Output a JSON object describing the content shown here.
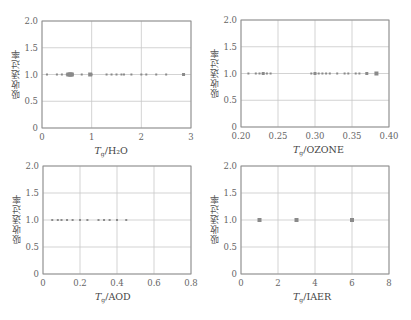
{
  "chart_data": [
    {
      "id": "h2o",
      "type": "scatter",
      "title": "",
      "ylabel": "吸收透过率",
      "xlabel_symbol": "T",
      "xlabel_sub": "g",
      "xlabel_var": "/H₂O",
      "xlim": [
        0,
        3
      ],
      "ylim": [
        0,
        2.0
      ],
      "xticks": [
        0,
        1,
        2,
        3
      ],
      "xtick_labels": [
        "0",
        "1",
        "2",
        "3"
      ],
      "yticks": [
        0,
        0.5,
        1.0,
        1.5,
        2.0
      ],
      "ytick_labels": [
        "0",
        "0.5",
        "1.0",
        "1.5",
        "2.0"
      ],
      "grid": true,
      "x": [
        0.1,
        0.3,
        0.4,
        0.5,
        0.53,
        0.56,
        0.58,
        0.6,
        0.62,
        0.8,
        0.97,
        1.0,
        1.3,
        1.4,
        1.5,
        1.6,
        1.65,
        1.8,
        2.0,
        2.1,
        2.3,
        2.5,
        2.85
      ],
      "y": [
        1.0,
        1.0,
        1.0,
        1.0,
        1.0,
        1.0,
        1.0,
        1.0,
        1.0,
        1.0,
        1.0,
        1.0,
        1.0,
        1.0,
        1.0,
        1.0,
        1.0,
        1.0,
        1.0,
        1.0,
        1.0,
        1.0,
        1.0
      ],
      "marker_sizes": [
        1,
        1,
        1,
        1,
        2,
        2,
        2,
        2,
        1,
        1,
        2,
        1,
        1,
        1,
        1,
        1,
        1,
        1,
        1,
        1,
        1,
        1,
        1.5
      ]
    },
    {
      "id": "ozone",
      "type": "scatter",
      "title": "",
      "ylabel": "吸收透过率",
      "xlabel_symbol": "T",
      "xlabel_sub": "g",
      "xlabel_var": "/OZONE",
      "xlim": [
        0.2,
        0.4
      ],
      "ylim": [
        0,
        2.0
      ],
      "xticks": [
        0.2,
        0.25,
        0.3,
        0.35,
        0.4
      ],
      "xtick_labels": [
        "0.20",
        "0.25",
        "0.30",
        "0.35",
        "0.40"
      ],
      "yticks": [
        0,
        0.5,
        1.0,
        1.5,
        2.0
      ],
      "ytick_labels": [
        "0",
        "0.5",
        "1.0",
        "1.5",
        "2.0"
      ],
      "grid": true,
      "x": [
        0.21,
        0.22,
        0.225,
        0.23,
        0.235,
        0.24,
        0.295,
        0.3,
        0.305,
        0.31,
        0.315,
        0.32,
        0.33,
        0.34,
        0.345,
        0.355,
        0.36,
        0.37,
        0.383
      ],
      "y": [
        1.0,
        1.0,
        1.0,
        1.0,
        1.0,
        1.0,
        1.0,
        1.0,
        1.0,
        1.0,
        1.0,
        1.0,
        1.0,
        1.0,
        1.0,
        1.0,
        1.0,
        1.0,
        1.0
      ],
      "marker_sizes": [
        1,
        1,
        1,
        1.5,
        1,
        1,
        1,
        1.5,
        1,
        1,
        1,
        1,
        1,
        1,
        1,
        1,
        1,
        1.5,
        2
      ]
    },
    {
      "id": "aod",
      "type": "scatter",
      "title": "",
      "ylabel": "吸收透过率",
      "xlabel_symbol": "T",
      "xlabel_sub": "g",
      "xlabel_var": "/AOD",
      "xlim": [
        0,
        0.8
      ],
      "ylim": [
        0,
        2.0
      ],
      "xticks": [
        0,
        0.2,
        0.4,
        0.6,
        0.8
      ],
      "xtick_labels": [
        "0",
        "0.2",
        "0.4",
        "0.6",
        "0.8"
      ],
      "yticks": [
        0,
        0.5,
        1.0,
        1.5,
        2.0
      ],
      "ytick_labels": [
        "0",
        "0.5",
        "1.0",
        "1.5",
        "2.0"
      ],
      "grid": true,
      "x": [
        0.05,
        0.08,
        0.1,
        0.13,
        0.16,
        0.2,
        0.24,
        0.3,
        0.33,
        0.36,
        0.4,
        0.45
      ],
      "y": [
        1.0,
        1.0,
        1.0,
        1.0,
        1.0,
        1.0,
        1.0,
        1.0,
        1.0,
        1.0,
        1.0,
        1.0
      ],
      "marker_sizes": [
        1,
        1,
        1,
        1,
        1,
        1,
        1,
        1,
        1,
        1,
        1,
        1
      ]
    },
    {
      "id": "iaer",
      "type": "scatter",
      "title": "",
      "ylabel": "吸收透过率",
      "xlabel_symbol": "T",
      "xlabel_sub": "g",
      "xlabel_var": "/IAER",
      "xlim": [
        0,
        8
      ],
      "ylim": [
        0,
        2.0
      ],
      "xticks": [
        0,
        2,
        4,
        6,
        8
      ],
      "xtick_labels": [
        "0",
        "2",
        "4",
        "6",
        "8"
      ],
      "yticks": [
        0,
        0.5,
        1.0,
        1.5,
        2.0
      ],
      "ytick_labels": [
        "0",
        "0.5",
        "1.0",
        "1.5",
        "2.0"
      ],
      "grid": true,
      "x": [
        1,
        3,
        6
      ],
      "y": [
        1.0,
        1.0,
        1.0
      ],
      "marker_sizes": [
        2,
        2,
        2
      ]
    }
  ],
  "layout": {
    "panels": [
      {
        "left": 42,
        "top": 21,
        "width": 149,
        "height": 107
      },
      {
        "left": 241,
        "top": 20,
        "width": 148,
        "height": 107
      },
      {
        "left": 43,
        "top": 166,
        "width": 148,
        "height": 108
      },
      {
        "left": 241,
        "top": 166,
        "width": 148,
        "height": 108
      }
    ],
    "colors": {
      "axis": "#888888",
      "grid": "#c8c8c8",
      "marker": "#8a8a8a",
      "text": "#666666"
    }
  }
}
